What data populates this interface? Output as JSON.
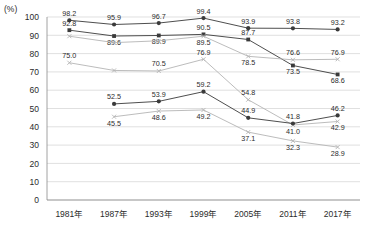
{
  "chart_data": {
    "type": "line",
    "title": "",
    "subtitle": "",
    "xlabel": "",
    "ylabel": "",
    "unit_label": "(%)",
    "ylim": [
      0,
      100
    ],
    "ytick_step": 10,
    "yticks": [
      "100",
      "90",
      "80",
      "70",
      "60",
      "50",
      "40",
      "30",
      "20",
      "10",
      "0"
    ],
    "grid": true,
    "legend_position": "none",
    "categories": [
      "1981年",
      "1987年",
      "1993年",
      "1999年",
      "2005年",
      "2011年",
      "2017年"
    ],
    "series": [
      {
        "name": "series-1-top-circle",
        "marker": "circle",
        "color": "#3a3a3a",
        "values": [
          98.2,
          95.9,
          96.7,
          99.4,
          93.9,
          93.8,
          93.2
        ],
        "labels": [
          "98.2",
          "95.9",
          "96.7",
          "99.4",
          "93.9",
          "93.8",
          "93.2"
        ],
        "label_pos": [
          "above",
          "above",
          "above",
          "above",
          "above",
          "above",
          "above"
        ]
      },
      {
        "name": "series-2-square-declining",
        "marker": "square",
        "color": "#3a3a3a",
        "values": [
          92.8,
          89.6,
          89.9,
          90.5,
          87.7,
          73.5,
          68.6
        ],
        "labels": [
          "92.8",
          "89.6",
          "89.9",
          "90.5",
          "87.7",
          "73.5",
          "68.6"
        ],
        "label_pos": [
          "above",
          "below",
          "below",
          "above",
          "above",
          "below",
          "below"
        ]
      },
      {
        "name": "series-3-grey-upper",
        "marker": "cross",
        "color": "#b4b4b4",
        "values": [
          89.5,
          86.0,
          87.0,
          89.5,
          78.5,
          76.6,
          76.9
        ],
        "labels": [
          "",
          "",
          "",
          "89.5",
          "78.5",
          "76.6",
          "76.9"
        ],
        "label_pos": [
          "below",
          "below",
          "below",
          "below",
          "below",
          "above",
          "above"
        ]
      },
      {
        "name": "series-4-grey-middle",
        "marker": "cross",
        "color": "#b4b4b4",
        "values": [
          75.0,
          70.8,
          70.5,
          76.9,
          54.8,
          41.0,
          42.9
        ],
        "labels": [
          "75.0",
          "",
          "70.5",
          "76.9",
          "54.8",
          "41.0",
          "42.9"
        ],
        "label_pos": [
          "above",
          "above",
          "above",
          "above",
          "above",
          "below",
          "below"
        ]
      },
      {
        "name": "series-5-circle-lower",
        "marker": "circle",
        "color": "#3a3a3a",
        "values": [
          null,
          52.5,
          53.9,
          59.2,
          44.9,
          41.8,
          46.2
        ],
        "labels": [
          "",
          "52.5",
          "53.9",
          "59.2",
          "44.9",
          "41.8",
          "46.2"
        ],
        "label_pos": [
          "above",
          "above",
          "above",
          "above",
          "above",
          "above",
          "above"
        ]
      },
      {
        "name": "series-6-grey-lower",
        "marker": "cross",
        "color": "#b4b4b4",
        "values": [
          null,
          45.5,
          48.6,
          49.2,
          37.1,
          32.3,
          28.9
        ],
        "labels": [
          "",
          "45.5",
          "48.6",
          "49.2",
          "37.1",
          "32.3",
          "28.9"
        ],
        "label_pos": [
          "below",
          "below",
          "below",
          "below",
          "below",
          "below",
          "below"
        ]
      }
    ]
  }
}
